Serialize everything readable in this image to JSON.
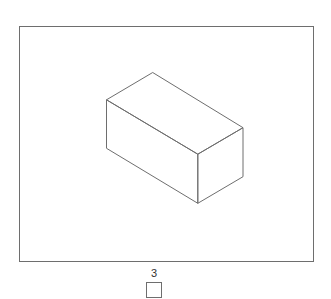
{
  "figure": {
    "shape": "rectangular-cuboid",
    "projection": "isometric",
    "stroke_color": "#6e6e6e",
    "vertices": {
      "top_back": [
        152.7,
        72.5
      ],
      "top_left": [
        106.5,
        99.8
      ],
      "top_right": [
        243,
        127.7
      ],
      "top_front": [
        197.8,
        154.2
      ],
      "bottom_left": [
        106.5,
        148.3
      ],
      "bottom_front": [
        197.8,
        203.3
      ],
      "bottom_right": [
        243,
        176.7
      ]
    }
  },
  "question": {
    "number": "3",
    "answer_box_value": ""
  }
}
